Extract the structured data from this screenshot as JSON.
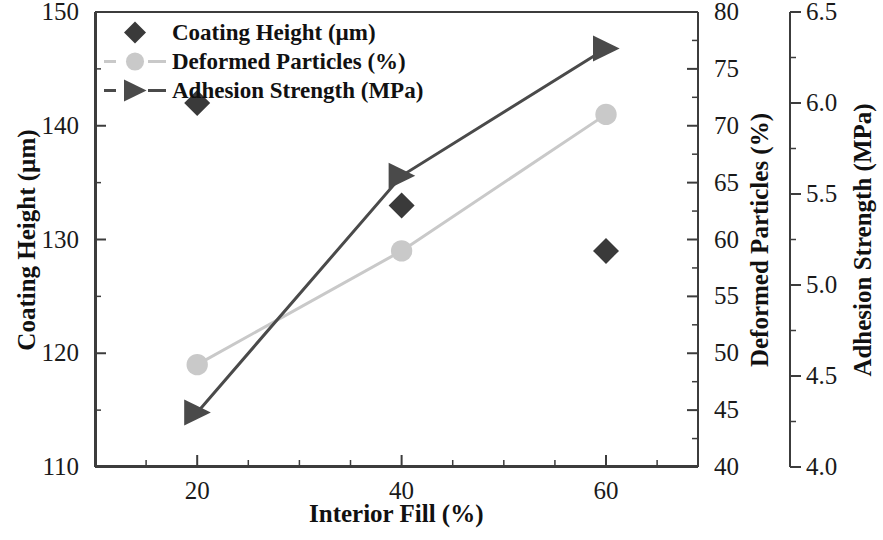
{
  "chart_data": {
    "type": "line",
    "title": "",
    "xlabel": "Interior Fill (%)",
    "x": [
      20,
      40,
      60
    ],
    "xlim": [
      10,
      69
    ],
    "xticks": [
      20,
      40,
      60
    ],
    "xticklabels": [
      "20",
      "40",
      "60"
    ],
    "grid": false,
    "legend_position": "top-left",
    "axes": [
      {
        "id": "y1",
        "label": "Coating Height (µm)",
        "unit": "µm",
        "side": "left",
        "ylim": [
          110,
          150
        ],
        "yticks": [
          110,
          120,
          130,
          140,
          150
        ],
        "yticklabels": [
          "110",
          "120",
          "130",
          "140",
          "150"
        ],
        "minor_tick_step": 5
      },
      {
        "id": "y2",
        "label": "Deformed Particles (%)",
        "unit": "%",
        "side": "right",
        "ylim": [
          40,
          80
        ],
        "yticks": [
          40,
          45,
          50,
          55,
          60,
          65,
          70,
          75,
          80
        ],
        "yticklabels": [
          "40",
          "45",
          "50",
          "55",
          "60",
          "65",
          "70",
          "75",
          "80"
        ],
        "minor_tick_step": 2.5
      },
      {
        "id": "y3",
        "label": "Adhesion Strength (MPa)",
        "unit": "MPa",
        "side": "right-outer",
        "ylim": [
          4.0,
          6.5
        ],
        "yticks": [
          4.0,
          4.5,
          5.0,
          5.5,
          6.0,
          6.5
        ],
        "yticklabels": [
          "4.0",
          "4.5",
          "5.0",
          "5.5",
          "6.0",
          "6.5"
        ],
        "minor_tick_step": 0.25
      }
    ],
    "series": [
      {
        "name": "Coating Height (µm)",
        "axis": "y1",
        "marker": "diamond",
        "color": "#3a3a3a",
        "line": "none",
        "values": [
          142,
          133,
          129
        ]
      },
      {
        "name": "Deformed Particles (%)",
        "axis": "y2",
        "marker": "circle",
        "color": "#c9c9c9",
        "line": "solid",
        "values": [
          49,
          59,
          71
        ]
      },
      {
        "name": "Adhesion Strength (MPa)",
        "axis": "y3",
        "marker": "triangle-right",
        "color": "#4a4a4a",
        "line": "solid",
        "values": [
          4.3,
          5.6,
          6.3
        ]
      }
    ]
  },
  "legend": {
    "items": [
      {
        "label": "Coating Height (µm)",
        "marker": "diamond",
        "color": "#3a3a3a",
        "show_line": false
      },
      {
        "label": "Deformed Particles (%)",
        "marker": "circle",
        "color": "#c9c9c9",
        "show_line": true
      },
      {
        "label": "Adhesion Strength (MPa)",
        "marker": "triangle-right",
        "color": "#4a4a4a",
        "show_line": true
      }
    ]
  },
  "colors": {
    "axis": "#3c3c3c",
    "text": "#1a1a1a",
    "coating_height": "#3a3a3a",
    "deformed_particles": "#c9c9c9",
    "adhesion_strength": "#4a4a4a"
  }
}
